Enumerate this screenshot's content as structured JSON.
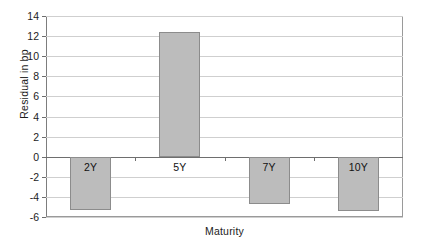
{
  "chart_data": {
    "type": "bar",
    "title": "",
    "xlabel": "Maturity",
    "ylabel": "Residual in bp",
    "categories": [
      "2Y",
      "5Y",
      "7Y",
      "10Y"
    ],
    "values": [
      -5.3,
      12.4,
      -4.7,
      -5.4
    ],
    "ylim": [
      -6,
      14
    ],
    "yticks": [
      -6,
      -4,
      -2,
      0,
      2,
      4,
      6,
      8,
      10,
      12,
      14
    ],
    "ytick_labels": [
      "-6",
      "-4",
      "-2",
      "0",
      "2",
      "4",
      "6",
      "8",
      "10",
      "12",
      "14"
    ],
    "grid": true,
    "legend": false,
    "bar_color": "#bcbcbc",
    "bar_edge_color": "#8c8c8c",
    "axis_color": "#6e6e6e",
    "grid_color": "#cfcfcf",
    "background": "#ffffff"
  }
}
